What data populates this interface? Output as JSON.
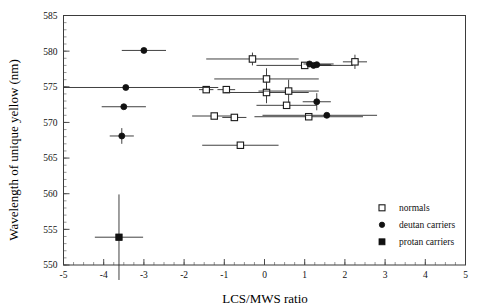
{
  "chart_data": {
    "type": "scatter",
    "title": "",
    "xlabel": "LCS/MWS ratio",
    "ylabel": "Wavelength of unique yellow (nm)",
    "xlim": [
      -5,
      5
    ],
    "ylim": [
      550,
      585
    ],
    "x_ticks": [
      -5,
      -4,
      -3,
      -2,
      -1,
      0,
      1,
      2,
      3,
      4,
      5
    ],
    "x_tick_labels": [
      "-5",
      "-4",
      "-3",
      "-2",
      "-1",
      "0",
      "1",
      "2",
      "3",
      "4",
      "5"
    ],
    "y_ticks": [
      550,
      555,
      560,
      565,
      570,
      575,
      580,
      585
    ],
    "y_tick_labels": [
      "550",
      "555",
      "560",
      "565",
      "570",
      "575",
      "580",
      "585"
    ],
    "x_minor_step": 0.25,
    "y_minor_step": 1,
    "grid": false,
    "legend_position": "bottom-right",
    "series": [
      {
        "name": "normals",
        "marker": "open-square",
        "points": [
          {
            "x": -1.45,
            "y": 574.6,
            "xerr_low": 0.18,
            "xerr_high": 0.18,
            "yerr": 0
          },
          {
            "x": -0.95,
            "y": 574.6,
            "xerr_low": 0.22,
            "xerr_high": 0.22,
            "yerr": 0
          },
          {
            "x": -1.25,
            "y": 570.9,
            "xerr_low": 0.55,
            "xerr_high": 0.55,
            "yerr": 0
          },
          {
            "x": -0.75,
            "y": 570.7,
            "xerr_low": 0.3,
            "xerr_high": 0.3,
            "yerr": 0
          },
          {
            "x": -0.6,
            "y": 566.8,
            "xerr_low": 0.95,
            "xerr_high": 0.95,
            "yerr": 0
          },
          {
            "x": -0.3,
            "y": 578.9,
            "xerr_low": 1.15,
            "xerr_high": 1.15,
            "yerr": 0.9
          },
          {
            "x": 0.05,
            "y": 576.1,
            "xerr_low": 1.3,
            "xerr_high": 1.3,
            "yerr": 1.5
          },
          {
            "x": 0.05,
            "y": 574.2,
            "xerr_low": 1.05,
            "xerr_high": 1.05,
            "yerr": 1.5
          },
          {
            "x": 0.55,
            "y": 572.4,
            "xerr_low": 0.75,
            "xerr_high": 0.75,
            "yerr": 0
          },
          {
            "x": 0.6,
            "y": 574.4,
            "xerr_low": 0.75,
            "xerr_high": 0.75,
            "yerr": 1.6
          },
          {
            "x": 1.0,
            "y": 578.0,
            "xerr_low": 1.2,
            "xerr_high": 1.2,
            "yerr": 0
          },
          {
            "x": 1.1,
            "y": 570.8,
            "xerr_low": 1.35,
            "xerr_high": 1.35,
            "yerr": 0
          },
          {
            "x": 2.25,
            "y": 578.5,
            "xerr_low": 0.3,
            "xerr_high": 0.3,
            "yerr": 1.0
          }
        ]
      },
      {
        "name": "deutan carriers",
        "marker": "filled-circle",
        "points": [
          {
            "x": -3.0,
            "y": 580.1,
            "xerr_low": 0.55,
            "xerr_high": 0.55,
            "yerr": 0
          },
          {
            "x": -3.45,
            "y": 574.9,
            "xerr_low": 1.55,
            "xerr_high": 2.3,
            "yerr": 0
          },
          {
            "x": -3.5,
            "y": 572.2,
            "xerr_low": 0.55,
            "xerr_high": 0.55,
            "yerr": 0
          },
          {
            "x": -3.55,
            "y": 568.1,
            "xerr_low": 0.3,
            "xerr_high": 0.3,
            "yerr": 1.1
          },
          {
            "x": 1.12,
            "y": 578.2,
            "xerr_low": 0.15,
            "xerr_high": 0.6,
            "yerr": 0
          },
          {
            "x": 1.22,
            "y": 578.0,
            "xerr_low": 0.12,
            "xerr_high": 0.45,
            "yerr": 0
          },
          {
            "x": 1.3,
            "y": 578.1,
            "xerr_low": 0.1,
            "xerr_high": 0.35,
            "yerr": 0
          },
          {
            "x": 1.3,
            "y": 572.9,
            "xerr_low": 0.35,
            "xerr_high": 0.35,
            "yerr": 1.2
          },
          {
            "x": 1.55,
            "y": 571.0,
            "xerr_low": 1.6,
            "xerr_high": 1.25,
            "yerr": 0
          }
        ]
      },
      {
        "name": "protan carriers",
        "marker": "filled-square",
        "points": [
          {
            "x": -3.62,
            "y": 553.9,
            "xerr_low": 0.6,
            "xerr_high": 0.6,
            "yerr": 6.0
          }
        ]
      }
    ]
  },
  "legend": {
    "entries": [
      {
        "label": "normals",
        "marker": "open-square"
      },
      {
        "label": "deutan carriers",
        "marker": "filled-circle"
      },
      {
        "label": "protan carriers",
        "marker": "filled-square"
      }
    ]
  },
  "axes": {
    "y_axis_title": "Wavelength of unique yellow (nm)",
    "x_axis_title": "LCS/MWS ratio"
  }
}
